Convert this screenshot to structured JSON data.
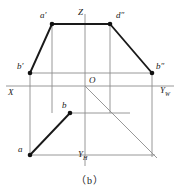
{
  "figure": {
    "caption": "（b）",
    "background_color": "#ffffff",
    "stroke_dark": "#1a1a1a",
    "stroke_thin": "#8c8c8c",
    "axes": {
      "z_label": "Z",
      "x_label": "X",
      "origin_label": "O",
      "y_w_label": "Y",
      "y_w_sub": "W",
      "y_h_label": "Y",
      "y_h_sub": "H"
    },
    "points": [
      {
        "id": "a-prime",
        "label": "a",
        "prime": "′",
        "x": 52,
        "y": 24,
        "lx": 40,
        "ly": 14,
        "dot": true
      },
      {
        "id": "d-double",
        "label": "d",
        "prime": "″",
        "x": 110,
        "y": 24,
        "lx": 116,
        "ly": 14,
        "dot": true
      },
      {
        "id": "b-prime",
        "label": "b",
        "prime": "′",
        "x": 30,
        "y": 73,
        "lx": 18,
        "ly": 64,
        "dot": true
      },
      {
        "id": "b-double",
        "label": "b",
        "prime": "″",
        "x": 152,
        "y": 73,
        "lx": 157,
        "ly": 64,
        "dot": true
      },
      {
        "id": "b-plan",
        "label": "b",
        "prime": "",
        "x": 70,
        "y": 113,
        "lx": 62,
        "ly": 103,
        "dot": true
      },
      {
        "id": "a-plan",
        "label": "a",
        "prime": "",
        "x": 30,
        "y": 155,
        "lx": 18,
        "ly": 148,
        "dot": true
      }
    ],
    "geometry": {
      "x_axis_y": 86,
      "z_axis_x": 85,
      "origin_x": 85,
      "origin_y": 86,
      "frame_left": 30,
      "frame_right": 152,
      "frame_bottom": 155,
      "top_edge_y": 24,
      "upper_band_y": 73,
      "plan_band_y": 113,
      "inner_left_x": 52,
      "inner_right_x": 110,
      "diagonal_end_x": 155,
      "diagonal_end_y": 157
    }
  }
}
